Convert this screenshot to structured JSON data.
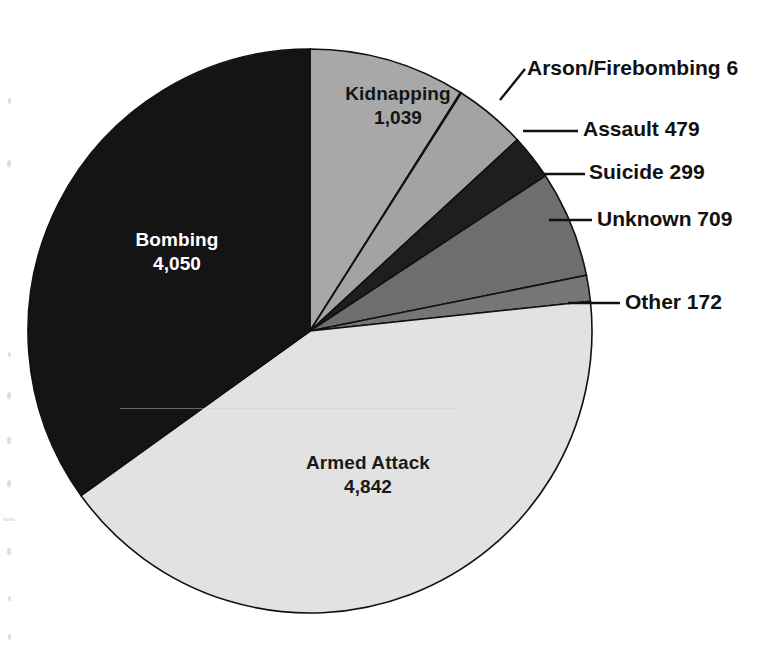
{
  "figure": {
    "type": "pie-chart-figure",
    "background_color": "#ffffff"
  },
  "chart_data": {
    "type": "pie",
    "title": "",
    "subtitle": "",
    "xlabel": "",
    "ylabel": "",
    "legend_position": "none",
    "grid": false,
    "total": 11596,
    "label_format": "name + value",
    "start_angle_deg": 0,
    "direction": "clockwise",
    "categories": [
      "Kidnapping",
      "Arson/Firebombing",
      "Assault",
      "Suicide",
      "Unknown",
      "Other",
      "Armed Attack",
      "Bombing"
    ],
    "values": [
      1039,
      6,
      479,
      299,
      709,
      172,
      4842,
      4050
    ],
    "slices": [
      {
        "name": "Kidnapping",
        "value": "1,039",
        "value_num": 1039,
        "label_text": "Kidnapping",
        "value_text": "1,039",
        "color": "#a8a8a8",
        "label_placement": "inside",
        "text_color": "#141414",
        "start_deg": 0,
        "sweep_deg": 32.26
      },
      {
        "name": "Arson/Firebombing",
        "value": "6",
        "value_num": 6,
        "label_text": "Arson/Firebombing 6",
        "value_text": "6",
        "color": "#ffffff",
        "label_placement": "callout",
        "text_color": "#111111",
        "start_deg": 32.26,
        "sweep_deg": 0.19
      },
      {
        "name": "Assault",
        "value": "479",
        "value_num": 479,
        "label_text": "Assault 479",
        "value_text": "479",
        "color": "#a3a3a3",
        "label_placement": "callout",
        "text_color": "#111111",
        "start_deg": 32.45,
        "sweep_deg": 14.87
      },
      {
        "name": "Suicide",
        "value": "299",
        "value_num": 299,
        "label_text": "Suicide 299",
        "value_text": "299",
        "color": "#1e1e1e",
        "label_placement": "callout",
        "text_color": "#111111",
        "start_deg": 47.32,
        "sweep_deg": 9.28
      },
      {
        "name": "Unknown",
        "value": "709",
        "value_num": 709,
        "label_text": "Unknown 709",
        "value_text": "709",
        "color": "#6e6e6e",
        "label_placement": "callout",
        "text_color": "#111111",
        "start_deg": 56.6,
        "sweep_deg": 22.01
      },
      {
        "name": "Other",
        "value": "172",
        "value_num": 172,
        "label_text": "Other 172",
        "value_text": "172",
        "color": "#767676",
        "label_placement": "callout",
        "text_color": "#111111",
        "start_deg": 78.61,
        "sweep_deg": 5.34
      },
      {
        "name": "Armed Attack",
        "value": "4,842",
        "value_num": 4842,
        "label_text": "Armed Attack",
        "value_text": "4,842",
        "color": "#e2e2e2",
        "label_placement": "inside",
        "text_color": "#1a1a1a",
        "start_deg": 83.95,
        "sweep_deg": 150.36
      },
      {
        "name": "Bombing",
        "value": "4,050",
        "value_num": 4050,
        "label_text": "Bombing",
        "value_text": "4,050",
        "color": "#141414",
        "label_placement": "inside",
        "text_color": "#ffffff",
        "start_deg": 234.31,
        "sweep_deg": 125.69
      }
    ],
    "callouts": [
      {
        "name": "arson",
        "text": "Arson/Firebombing 6"
      },
      {
        "name": "assault",
        "text": "Assault 479"
      },
      {
        "name": "suicide",
        "text": "Suicide 299"
      },
      {
        "name": "unknown",
        "text": "Unknown 709"
      },
      {
        "name": "other",
        "text": "Other 172"
      }
    ],
    "geometry": {
      "center_x": 310,
      "center_y": 331,
      "radius": 282
    }
  }
}
